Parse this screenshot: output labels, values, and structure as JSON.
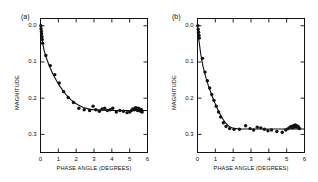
{
  "figure": {
    "background": "#ffffff",
    "ink": "#111111",
    "panels": [
      {
        "id": "a",
        "label": "(a)",
        "axis": {
          "xlabel": "PHASE  ANGLE  (DEGREES)",
          "ylabel": "MAGNITUDE",
          "xticks": [
            "0",
            "1",
            "2",
            "3",
            "4",
            "5",
            "6"
          ],
          "yticks": [
            "0.0",
            "0.1",
            "0.2",
            "0.3"
          ],
          "xlim": [
            0,
            6
          ],
          "ylim": [
            0.35,
            -0.02
          ],
          "y_inverted": true,
          "grid": false
        },
        "chart_data": {
          "type": "scatter",
          "title": "(a)",
          "xlabel": "PHASE  ANGLE  (DEGREES)",
          "ylabel": "MAGNITUDE",
          "xlim": [
            0,
            6
          ],
          "ylim": [
            0.35,
            -0.02
          ],
          "grid": false,
          "legend": "none",
          "series": [
            {
              "name": "observations",
              "marker": "filled-circle",
              "color": "#111111",
              "x": [
                0.02,
                0.03,
                0.05,
                0.06,
                0.08,
                0.1,
                0.12,
                0.3,
                0.55,
                0.8,
                1.05,
                1.3,
                1.55,
                1.85,
                2.15,
                2.45,
                2.75,
                2.95,
                3.1,
                3.3,
                3.45,
                3.6,
                3.75,
                3.9,
                4.05,
                4.25,
                4.45,
                4.65,
                4.85,
                5.0,
                5.1,
                5.18,
                5.25,
                5.3,
                5.35,
                5.38,
                5.42,
                5.45,
                5.48,
                5.52,
                5.55,
                5.58,
                5.62,
                5.66,
                5.7
              ],
              "y": [
                0.0,
                0.008,
                0.016,
                0.022,
                0.03,
                0.038,
                0.048,
                0.082,
                0.11,
                0.135,
                0.158,
                0.182,
                0.198,
                0.212,
                0.228,
                0.232,
                0.234,
                0.222,
                0.232,
                0.236,
                0.23,
                0.228,
                0.234,
                0.232,
                0.228,
                0.238,
                0.234,
                0.236,
                0.24,
                0.238,
                0.234,
                0.23,
                0.232,
                0.228,
                0.226,
                0.232,
                0.23,
                0.234,
                0.228,
                0.232,
                0.23,
                0.234,
                0.236,
                0.232,
                0.238
              ]
            },
            {
              "name": "fitted-curve",
              "marker": "none",
              "line": "solid",
              "color": "#111111",
              "x": [
                0.0,
                0.1,
                0.2,
                0.35,
                0.5,
                0.7,
                0.9,
                1.1,
                1.3,
                1.5,
                1.7,
                1.9,
                2.1,
                2.4,
                2.8,
                3.4,
                4.0,
                4.6,
                5.2,
                5.8,
                6.0
              ],
              "y": [
                0.0,
                0.042,
                0.068,
                0.092,
                0.112,
                0.134,
                0.152,
                0.168,
                0.182,
                0.194,
                0.204,
                0.212,
                0.218,
                0.226,
                0.231,
                0.233,
                0.234,
                0.234,
                0.234,
                0.234,
                0.234
              ]
            }
          ]
        }
      },
      {
        "id": "b",
        "label": "(b)",
        "axis": {
          "xlabel": "PHASE  ANGLE  (DEGREES)",
          "ylabel": "MAGNITUDE",
          "xticks": [
            "0",
            "1",
            "2",
            "3",
            "4",
            "5",
            "6"
          ],
          "yticks": [
            "0.0",
            "0.1",
            "0.2",
            "0.3"
          ],
          "xlim": [
            0,
            6
          ],
          "ylim": [
            0.35,
            -0.02
          ],
          "y_inverted": true,
          "grid": false
        },
        "chart_data": {
          "type": "scatter",
          "title": "(b)",
          "xlabel": "PHASE  ANGLE  (DEGREES)",
          "ylabel": "MAGNITUDE",
          "xlim": [
            0,
            6
          ],
          "ylim": [
            0.35,
            -0.02
          ],
          "grid": false,
          "legend": "none",
          "series": [
            {
              "name": "observations",
              "marker": "filled-circle",
              "color": "#111111",
              "x": [
                0.02,
                0.04,
                0.06,
                0.08,
                0.1,
                0.28,
                0.42,
                0.55,
                0.68,
                0.8,
                0.92,
                1.05,
                1.18,
                1.3,
                1.45,
                1.6,
                1.8,
                2.05,
                2.35,
                2.7,
                2.95,
                3.15,
                3.35,
                3.55,
                3.75,
                3.95,
                4.15,
                4.45,
                4.75,
                4.95,
                5.08,
                5.18,
                5.26,
                5.32,
                5.38,
                5.44,
                5.48,
                5.52,
                5.56,
                5.6,
                5.64,
                5.68,
                5.72
              ],
              "y": [
                0.0,
                0.01,
                0.018,
                0.026,
                0.034,
                0.09,
                0.128,
                0.152,
                0.172,
                0.19,
                0.206,
                0.222,
                0.238,
                0.252,
                0.268,
                0.278,
                0.284,
                0.286,
                0.286,
                0.276,
                0.284,
                0.288,
                0.28,
                0.282,
                0.286,
                0.29,
                0.288,
                0.292,
                0.294,
                0.288,
                0.284,
                0.28,
                0.278,
                0.282,
                0.276,
                0.28,
                0.274,
                0.278,
                0.276,
                0.28,
                0.278,
                0.282,
                0.284
              ]
            },
            {
              "name": "fitted-curve",
              "marker": "none",
              "line": "solid",
              "color": "#111111",
              "x": [
                0.0,
                0.08,
                0.18,
                0.3,
                0.45,
                0.6,
                0.8,
                1.0,
                1.2,
                1.4,
                1.6,
                1.8,
                2.0,
                2.4,
                3.0,
                3.6,
                4.2,
                4.8,
                5.4,
                6.0
              ],
              "y": [
                0.0,
                0.04,
                0.078,
                0.11,
                0.14,
                0.164,
                0.192,
                0.216,
                0.238,
                0.256,
                0.27,
                0.279,
                0.283,
                0.285,
                0.285,
                0.285,
                0.285,
                0.285,
                0.285,
                0.285
              ]
            }
          ]
        }
      }
    ]
  }
}
